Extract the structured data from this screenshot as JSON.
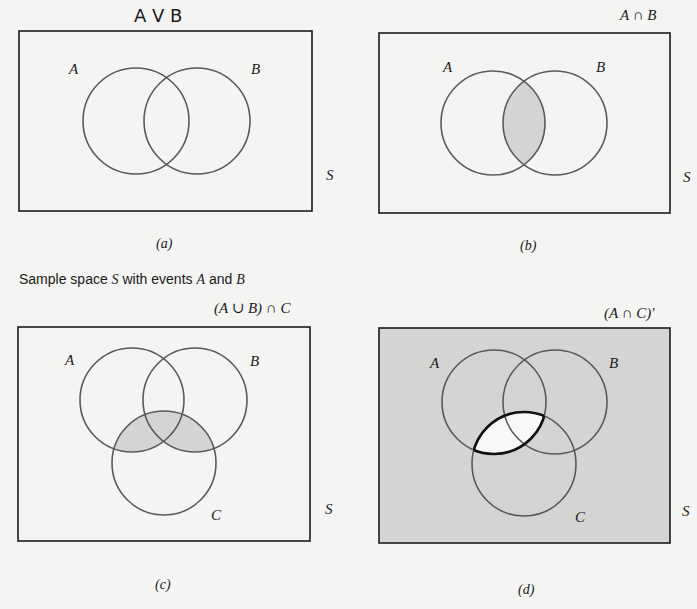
{
  "figure": {
    "caption": {
      "prefix": "Sample space ",
      "S": "S",
      "mid": " with events ",
      "A": "A",
      "and": " and ",
      "B": "B"
    },
    "panels": [
      {
        "id": "a",
        "sublabel": "(a)",
        "title": "A V B",
        "title_style": "handwritten",
        "set_labels": {
          "A": "A",
          "B": "B",
          "S": "S"
        },
        "shaded_region": "none"
      },
      {
        "id": "b",
        "sublabel": "(b)",
        "title": "A ∩ B",
        "set_labels": {
          "A": "A",
          "B": "B",
          "S": "S"
        },
        "shaded_region": "A ∩ B"
      },
      {
        "id": "c",
        "sublabel": "(c)",
        "title": "(A ∪ B) ∩ C",
        "set_labels": {
          "A": "A",
          "B": "B",
          "C": "C",
          "S": "S"
        },
        "shaded_region": "(A ∪ B) ∩ C"
      },
      {
        "id": "d",
        "sublabel": "(d)",
        "title": "(A ∩ C)′",
        "set_labels": {
          "A": "A",
          "B": "B",
          "C": "C",
          "S": "S"
        },
        "shaded_region": "complement of A ∩ C"
      }
    ]
  },
  "colors": {
    "background": "#f4f4f2",
    "stroke": "#1a1a1a",
    "circle_stroke": "#5a5a5a",
    "shade": "#d4d4d2",
    "unshaded": "#f8f8f6"
  }
}
